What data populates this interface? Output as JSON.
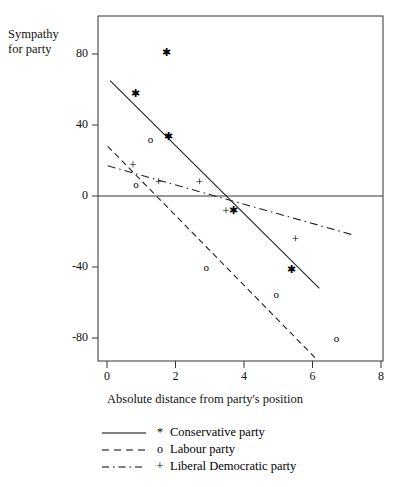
{
  "chart_data": {
    "type": "scatter",
    "title": "",
    "xlabel": "Absolute distance from party's position",
    "ylabel": "Sympathy for party",
    "ylabel_line1": "Sympathy",
    "ylabel_line2": "for party",
    "xlim": [
      0,
      8
    ],
    "ylim": [
      -95,
      95
    ],
    "xticks": [
      0,
      2,
      4,
      6,
      8
    ],
    "xtick_labels": [
      "0",
      "2",
      "4",
      "6",
      "8"
    ],
    "yticks": [
      80,
      40,
      0,
      -40,
      -80
    ],
    "ytick_labels": [
      "80",
      "40",
      "0",
      "-40",
      "-80"
    ],
    "grid": false,
    "zero_line": true,
    "legend_position": "below",
    "series": [
      {
        "name": "Conservative party",
        "marker": "*",
        "linestyle": "solid",
        "points": [
          {
            "x": 0.82,
            "y": 58
          },
          {
            "x": 1.73,
            "y": 81
          },
          {
            "x": 1.8,
            "y": 34
          },
          {
            "x": 3.7,
            "y": -8
          },
          {
            "x": 5.4,
            "y": -41
          }
        ],
        "fit_line": {
          "x0": 0.09,
          "y0": 65,
          "x1": 6.2,
          "y1": -52
        }
      },
      {
        "name": "Labour party",
        "marker": "o",
        "linestyle": "dashed",
        "points": [
          {
            "x": 0.85,
            "y": 7
          },
          {
            "x": 1.27,
            "y": 32
          },
          {
            "x": 2.9,
            "y": -40
          },
          {
            "x": 4.94,
            "y": -55
          },
          {
            "x": 6.7,
            "y": -80
          }
        ],
        "fit_line": {
          "x0": 0.02,
          "y0": 28,
          "x1": 6.12,
          "y1": -92
        }
      },
      {
        "name": "Liberal Democratic party",
        "marker": "+",
        "linestyle": "dashdot",
        "points": [
          {
            "x": 0.76,
            "y": 18
          },
          {
            "x": 1.5,
            "y": 8
          },
          {
            "x": 2.7,
            "y": 8
          },
          {
            "x": 3.47,
            "y": -8
          },
          {
            "x": 5.5,
            "y": -24
          }
        ],
        "fit_line": {
          "x0": 0.02,
          "y0": 17,
          "x1": 7.2,
          "y1": -22
        }
      }
    ],
    "legend": [
      {
        "label": "Conservative party",
        "marker": "*",
        "linestyle": "solid"
      },
      {
        "label": "Labour party",
        "marker": "o",
        "linestyle": "dashed"
      },
      {
        "label": "Liberal Democratic party",
        "marker": "+",
        "linestyle": "dashdot"
      }
    ]
  }
}
